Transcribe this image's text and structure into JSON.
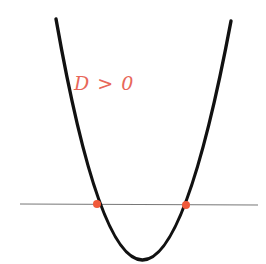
{
  "diagram": {
    "label": "D > 0",
    "colors": {
      "curve": "#111111",
      "axis": "#777777",
      "points": "#f05a3a",
      "label": "#e8675a"
    },
    "parabola": {
      "left_top": [
        56,
        19
      ],
      "right_top": [
        231,
        21
      ],
      "vertex": [
        141,
        259
      ]
    },
    "line": {
      "x1": 20,
      "x2": 258,
      "y": 204
    },
    "intersections": [
      {
        "x": 97,
        "y": 204
      },
      {
        "x": 186,
        "y": 205
      }
    ]
  }
}
